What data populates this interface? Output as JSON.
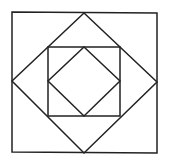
{
  "diagram": {
    "stroke_color": "#222222",
    "background": "#ffffff",
    "shapes": [
      {
        "name": "outer-square",
        "points": [
          [
            12,
            12
          ],
          [
            157,
            13
          ],
          [
            157,
            153
          ],
          [
            12,
            152
          ]
        ]
      },
      {
        "name": "outer-diamond",
        "points": [
          [
            84,
            13
          ],
          [
            157,
            82
          ],
          [
            84,
            153
          ],
          [
            12,
            81
          ]
        ]
      },
      {
        "name": "inner-square",
        "points": [
          [
            48,
            47
          ],
          [
            120,
            47
          ],
          [
            120,
            116
          ],
          [
            48,
            116
          ]
        ]
      },
      {
        "name": "inner-diamond",
        "points": [
          [
            84,
            47
          ],
          [
            120,
            81
          ],
          [
            84,
            116
          ],
          [
            48,
            81
          ]
        ]
      }
    ]
  }
}
